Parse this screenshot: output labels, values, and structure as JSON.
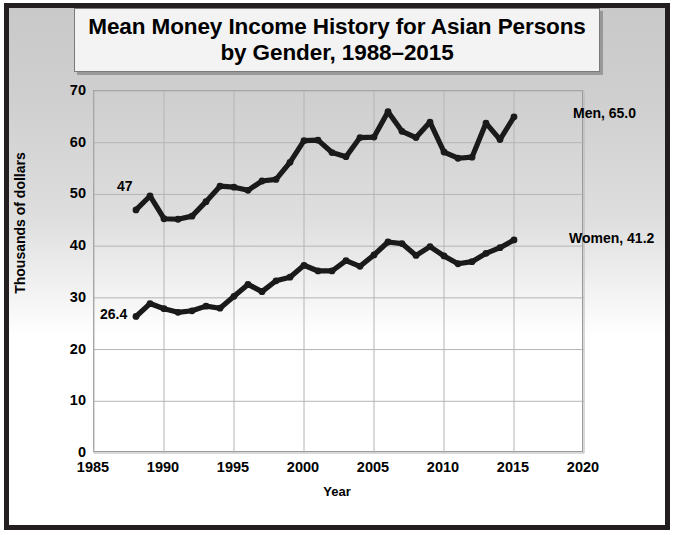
{
  "title": "Mean Money Income History for Asian Persons by Gender, 1988–2015",
  "axis": {
    "xlabel": "Year",
    "ylabel": "Thousands of dollars",
    "xticks": [
      "1985",
      "1990",
      "1995",
      "2000",
      "2005",
      "2010",
      "2015",
      "2020"
    ],
    "yticks": [
      "70",
      "60",
      "50",
      "40",
      "30",
      "20",
      "10",
      "0"
    ]
  },
  "annotations": {
    "men_start": "47",
    "women_start": "26.4",
    "men_end": "Men, 65.0",
    "women_end": "Women, 41.2"
  },
  "colors": {
    "series": "#1a1a1a",
    "grid": "#b4b4b4",
    "frame": "#231f20",
    "title_bg": "#f3f3f3"
  },
  "chart_data": {
    "type": "line",
    "title": "Mean Money Income History for Asian Persons by Gender, 1988–2015",
    "xlabel": "Year",
    "ylabel": "Thousands of dollars",
    "xlim": [
      1985,
      2020
    ],
    "ylim": [
      0,
      70
    ],
    "xticks": [
      1985,
      1990,
      1995,
      2000,
      2005,
      2010,
      2015,
      2020
    ],
    "yticks": [
      0,
      10,
      20,
      30,
      40,
      50,
      60,
      70
    ],
    "grid": true,
    "legend": "inline-end-labels",
    "x": [
      1988,
      1989,
      1990,
      1991,
      1992,
      1993,
      1994,
      1995,
      1996,
      1997,
      1998,
      1999,
      2000,
      2001,
      2002,
      2003,
      2004,
      2005,
      2006,
      2007,
      2008,
      2009,
      2010,
      2011,
      2012,
      2013,
      2014,
      2015
    ],
    "series": [
      {
        "name": "Men",
        "end_label": "Men, 65.0",
        "start_label": "47",
        "values": [
          47.0,
          49.7,
          45.3,
          45.2,
          45.8,
          48.6,
          51.6,
          51.4,
          50.8,
          52.6,
          52.9,
          56.2,
          60.4,
          60.5,
          58.1,
          57.3,
          61.0,
          61.1,
          66.0,
          62.2,
          61.0,
          64.0,
          58.2,
          57.0,
          57.2,
          63.8,
          60.6,
          65.0
        ]
      },
      {
        "name": "Women",
        "end_label": "Women, 41.2",
        "start_label": "26.4",
        "values": [
          26.4,
          28.9,
          27.9,
          27.2,
          27.5,
          28.4,
          28.0,
          30.3,
          32.6,
          31.2,
          33.3,
          34.0,
          36.3,
          35.2,
          35.2,
          37.2,
          36.1,
          38.3,
          40.8,
          40.5,
          38.2,
          39.9,
          38.1,
          36.6,
          37.0,
          38.6,
          39.7,
          41.2
        ]
      }
    ]
  }
}
